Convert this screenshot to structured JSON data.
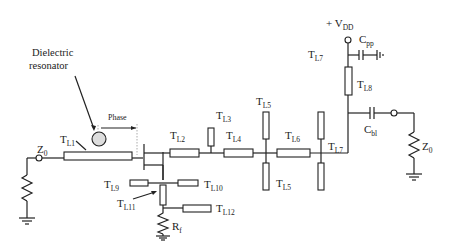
{
  "diagram": {
    "annotations": {
      "dielectric_line1": "Dielectric",
      "dielectric_line2": "resonator",
      "phase": "Phase",
      "vdd": "+ V",
      "vdd_sub": "DD"
    },
    "components": {
      "tl1": {
        "main": "T",
        "sub": "L1"
      },
      "tl2": {
        "main": "T",
        "sub": "L2"
      },
      "tl3": {
        "main": "T",
        "sub": "L3"
      },
      "tl4": {
        "main": "T",
        "sub": "L4"
      },
      "tl5_top": {
        "main": "T",
        "sub": "L5"
      },
      "tl5_bot": {
        "main": "T",
        "sub": "L5"
      },
      "tl6": {
        "main": "T",
        "sub": "L6"
      },
      "tl7_top": {
        "main": "T",
        "sub": "L7"
      },
      "tl7_bot": {
        "main": "T",
        "sub": "L7"
      },
      "tl8": {
        "main": "T",
        "sub": "L8"
      },
      "tl9": {
        "main": "T",
        "sub": "L9"
      },
      "tl10": {
        "main": "T",
        "sub": "L10"
      },
      "tl11": {
        "main": "T",
        "sub": "L11"
      },
      "tl12": {
        "main": "T",
        "sub": "L12"
      },
      "z0_in": {
        "main": "Z",
        "sub": "0"
      },
      "z0_out": {
        "main": "Z",
        "sub": "0"
      },
      "rf": {
        "main": "R",
        "sub": "f"
      },
      "cpp": {
        "main": "C",
        "sub": "pp"
      },
      "cbl": {
        "main": "C",
        "sub": "bl"
      }
    }
  }
}
